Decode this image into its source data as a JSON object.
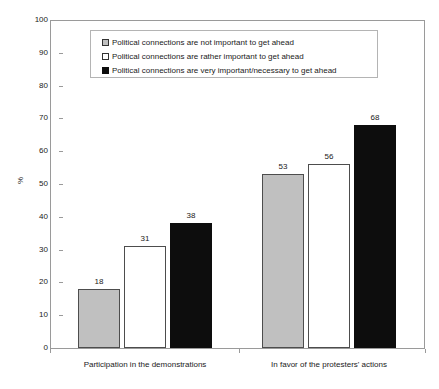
{
  "chart_data": {
    "type": "bar",
    "title": "",
    "subtitle": "",
    "xlabel": "",
    "ylabel": "%",
    "ylim": [
      0,
      100
    ],
    "ytick_step": 10,
    "ytick_labels": [
      "100",
      "90",
      "80",
      "70",
      "60",
      "50",
      "40",
      "30",
      "20",
      "10",
      "0"
    ],
    "grid": false,
    "legend_position": "top-center",
    "categories": [
      "Participation in the demonstrations",
      "In favor of the protesters' actions"
    ],
    "series": [
      {
        "name": "Political connections are not important to get ahead",
        "swatch": "gray",
        "color": "#c0c0c0",
        "values": [
          18,
          53
        ]
      },
      {
        "name": "Political connections are rather important to get ahead",
        "swatch": "white",
        "color": "#ffffff",
        "values": [
          31,
          56
        ]
      },
      {
        "name": "Political connections are very important/necessary to get ahead",
        "swatch": "black",
        "color": "#0d0d0d",
        "values": [
          38,
          68
        ]
      }
    ]
  },
  "colors": {
    "series_gray": "#c0c0c0",
    "series_white": "#ffffff",
    "series_black": "#0d0d0d",
    "axis": "#9a9a9a",
    "text": "#1a1a1a",
    "legend_border": "#b4b4b4",
    "background": "#ffffff"
  }
}
